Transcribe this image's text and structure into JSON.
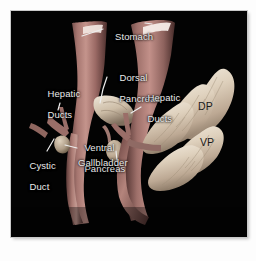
{
  "figure": {
    "kind": "anatomical-illustration",
    "background_color": "#030303",
    "page_color": "#ffffff",
    "label_color": "#e9e9e9",
    "dark_label_color": "#1a1a1a",
    "tissue_light": "#e8ddcf",
    "tissue_mid": "#c9b9a6",
    "duct_color": "#a8756e",
    "stomach_color": "#9a6f6a",
    "panels": [
      {
        "id": "left-panel",
        "name": "earlier-stage"
      },
      {
        "id": "right-panel",
        "name": "later-stage"
      }
    ]
  },
  "labels": {
    "stomach": "Stomach",
    "dorsal_pancreas": "Dorsal\nPancreas",
    "dorsal_pancreas_line1": "Dorsal",
    "dorsal_pancreas_line2": "Pancreas",
    "hepatic_ducts_left_line1": "Hepatic",
    "hepatic_ducts_left_line2": "Ducts",
    "hepatic_ducts_right_line1": "Hepatic",
    "hepatic_ducts_right_line2": "Ducts",
    "ventral_pancreas_line1": "Ventral",
    "ventral_pancreas_line2": "Pancreas",
    "cystic_duct_line1": "Cystic",
    "cystic_duct_line2": "Duct",
    "gallbladder": "Gallbladder",
    "dp_abbrev": "DP",
    "vp_abbrev": "VP"
  }
}
